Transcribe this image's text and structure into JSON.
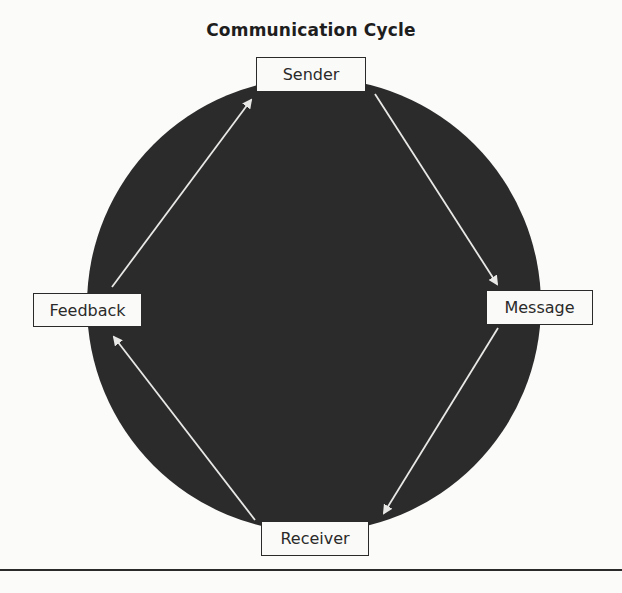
{
  "title": "Communication Cycle",
  "nodes": {
    "sender": {
      "label": "Sender"
    },
    "message": {
      "label": "Message"
    },
    "receiver": {
      "label": "Receiver"
    },
    "feedback": {
      "label": "Feedback"
    }
  },
  "edges": [
    {
      "from": "Sender",
      "to": "Message"
    },
    {
      "from": "Message",
      "to": "Receiver"
    },
    {
      "from": "Receiver",
      "to": "Feedback"
    },
    {
      "from": "Feedback",
      "to": "Sender"
    }
  ],
  "colors": {
    "circle_fill": "#2b2b2b",
    "arrow": "#e8e8e6",
    "node_fill": "#fafaf8",
    "node_border": "#2a2a2a",
    "background": "#fbfbfa"
  }
}
